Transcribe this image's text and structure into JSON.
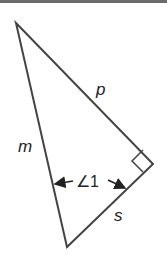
{
  "diagram": {
    "type": "right-triangle",
    "colors": {
      "stroke": "#444444",
      "text": "#222222",
      "background": "#ffffff"
    },
    "vertices": {
      "top": [
        16,
        23
      ],
      "right_angle": [
        153,
        164
      ],
      "bottom": [
        67,
        247
      ]
    },
    "labels": {
      "side_p": "p",
      "side_m": "m",
      "side_s": "s",
      "angle": "∠1"
    }
  }
}
